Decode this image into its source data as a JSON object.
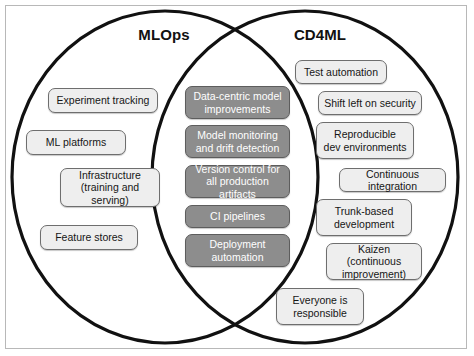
{
  "figure": {
    "type": "venn-diagram",
    "set_count": 2,
    "titles": {
      "left": "MLOps",
      "right": "CD4ML"
    }
  },
  "colors": {
    "circle_stroke": "#111111",
    "light_box_fill": "#eeeeee",
    "dark_box_fill": "#8d8d8d",
    "light_box_text": "#161616",
    "dark_box_text": "#ffffff",
    "frame": "#b8b8b8",
    "background": "#ffffff"
  },
  "left_only": [
    {
      "label": "Experiment tracking",
      "lines": [
        "Experiment tracking"
      ]
    },
    {
      "label": "ML platforms",
      "lines": [
        "ML platforms"
      ]
    },
    {
      "label": "Infrastructure (training and serving)",
      "lines": [
        "Infrastructure",
        "(training and serving)"
      ]
    },
    {
      "label": "Feature stores",
      "lines": [
        "Feature stores"
      ]
    }
  ],
  "intersection": [
    {
      "label": "Data-centric model improvements",
      "lines": [
        "Data-centric model",
        "improvements"
      ]
    },
    {
      "label": "Model monitoring and drift detection",
      "lines": [
        "Model monitoring",
        "and drift detection"
      ]
    },
    {
      "label": "Version control for all production artifacts",
      "lines": [
        "Version control for",
        "all production artifacts"
      ]
    },
    {
      "label": "CI pipelines",
      "lines": [
        "CI pipelines"
      ]
    },
    {
      "label": "Deployment automation",
      "lines": [
        "Deployment",
        "automation"
      ]
    }
  ],
  "right_only": [
    {
      "label": "Test automation",
      "lines": [
        "Test automation"
      ]
    },
    {
      "label": "Shift left on security",
      "lines": [
        "Shift left on security"
      ]
    },
    {
      "label": "Reproducible dev environments",
      "lines": [
        "Reproducible",
        "dev environments"
      ]
    },
    {
      "label": "Continuous integration",
      "lines": [
        "Continuous integration"
      ]
    },
    {
      "label": "Trunk-based development",
      "lines": [
        "Trunk-based",
        "development"
      ]
    },
    {
      "label": "Kaizen (continuous improvement)",
      "lines": [
        "Kaizen (continuous",
        "improvement)"
      ]
    },
    {
      "label": "Everyone is responsible",
      "lines": [
        "Everyone is",
        "responsible"
      ]
    }
  ]
}
